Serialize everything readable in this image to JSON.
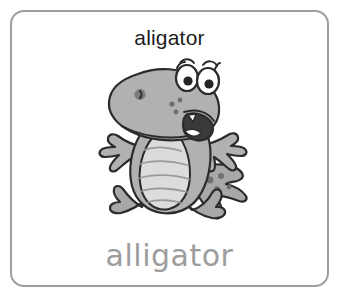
{
  "card": {
    "border_color": "#9e9e9e",
    "background_color": "#ffffff",
    "prompt_word": "aligator",
    "prompt_color": "#1c1c1c",
    "answer_word": "alligator",
    "answer_color": "#9d9d9d"
  },
  "illustration": {
    "name": "cartoon-alligator",
    "description": "Grayscale cartoon alligator standing with arms outstretched, large snout facing left, big round eyes, open smiling mouth with teeth, striped light belly, spotted tail and webbed feet",
    "body_color": "#b0b0b0",
    "belly_color": "#dcdcdc",
    "outline_color": "#2b2b2b",
    "eye_white_color": "#ffffff",
    "mouth_color": "#3a3a3a"
  }
}
